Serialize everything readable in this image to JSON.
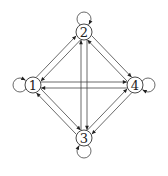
{
  "diagram": {
    "type": "directed-graph",
    "nodes": [
      {
        "id": "1",
        "label": "1",
        "x": 33,
        "y": 85
      },
      {
        "id": "2",
        "label": "2",
        "x": 84,
        "y": 32
      },
      {
        "id": "3",
        "label": "3",
        "x": 84,
        "y": 138
      },
      {
        "id": "4",
        "label": "4",
        "x": 135,
        "y": 85
      }
    ],
    "node_radius": 8,
    "edges": [
      {
        "from": "1",
        "to": "2"
      },
      {
        "from": "2",
        "to": "1"
      },
      {
        "from": "2",
        "to": "4"
      },
      {
        "from": "4",
        "to": "2"
      },
      {
        "from": "1",
        "to": "3"
      },
      {
        "from": "3",
        "to": "1"
      },
      {
        "from": "3",
        "to": "4"
      },
      {
        "from": "4",
        "to": "3"
      },
      {
        "from": "1",
        "to": "4"
      },
      {
        "from": "4",
        "to": "1"
      },
      {
        "from": "2",
        "to": "3"
      },
      {
        "from": "3",
        "to": "2"
      }
    ],
    "self_loops": [
      {
        "node": "1",
        "side": "left"
      },
      {
        "node": "2",
        "side": "top"
      },
      {
        "node": "3",
        "side": "bottom"
      },
      {
        "node": "4",
        "side": "right"
      }
    ],
    "colors": {
      "stroke": "#444444",
      "arrow": "#222222",
      "background": "#ffffff"
    }
  }
}
